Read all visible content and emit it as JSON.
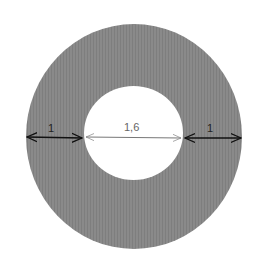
{
  "diagram": {
    "type": "annular-ring",
    "colors": {
      "ring_fill": "#888888",
      "hole_fill": "#ffffff",
      "dim_dark": "#111111",
      "dim_light": "#777777",
      "label_dark": "#222222",
      "label_light": "#666666"
    },
    "dimensions": [
      {
        "label": "1",
        "description": "ring width (left)"
      },
      {
        "label": "1,6",
        "description": "inner diameter"
      },
      {
        "label": "1",
        "description": "ring width (right)"
      }
    ]
  }
}
